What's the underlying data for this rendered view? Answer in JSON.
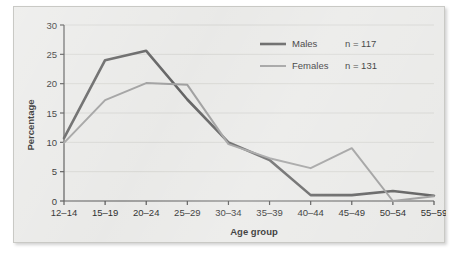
{
  "chart_data": {
    "type": "line",
    "title": "",
    "xlabel": "Age group",
    "ylabel": "Percentage",
    "categories": [
      "12–14",
      "15–19",
      "20–24",
      "25–29",
      "30–34",
      "35–39",
      "40–44",
      "45–49",
      "50–54",
      "55–59"
    ],
    "ylim": [
      0,
      30
    ],
    "yticks": [
      0,
      5,
      10,
      15,
      20,
      25,
      30
    ],
    "ytick_labels": [
      "0",
      "5",
      "10",
      "15",
      "20",
      "25",
      "30"
    ],
    "grid": true,
    "legend_position": "top-right",
    "series": [
      {
        "name": "Males",
        "n_label": "n = 117",
        "color": "#5a5a5a",
        "values": [
          10.7,
          24.0,
          25.6,
          17.3,
          10.0,
          7.0,
          1.0,
          1.0,
          1.7,
          0.9
        ]
      },
      {
        "name": "Females",
        "n_label": "n = 131",
        "color": "#9a9a9a",
        "values": [
          9.9,
          17.2,
          20.1,
          19.8,
          9.7,
          7.3,
          5.6,
          9.0,
          0.0,
          0.8
        ]
      }
    ]
  },
  "colors": {
    "panel_background": "#e8e8e6",
    "panel_border": "#c9c9c5",
    "axis": "#4a4a4a",
    "grid": "#cfcfcb",
    "males_line": "#5a5a5a",
    "females_line": "#9a9a9a",
    "text": "#1a1a1a"
  }
}
